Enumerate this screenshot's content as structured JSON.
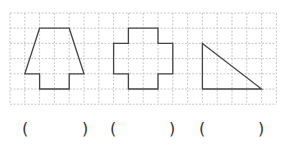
{
  "grid": {
    "origin_x": 10,
    "origin_y": 13,
    "cols": 18,
    "rows": 6,
    "cell_w": 14.8,
    "cell_h": 15.2,
    "line_color": "#c8c8c8",
    "shape_color": "#444444"
  },
  "shapes": [
    {
      "name": "trapezoid-house-shape",
      "points": [
        [
          2,
          1
        ],
        [
          4,
          1
        ],
        [
          5,
          4
        ],
        [
          4,
          4
        ],
        [
          4,
          5
        ],
        [
          2,
          5
        ],
        [
          2,
          4
        ],
        [
          1,
          4
        ]
      ]
    },
    {
      "name": "cross-shape",
      "points": [
        [
          8,
          1
        ],
        [
          10,
          1
        ],
        [
          10,
          2
        ],
        [
          11,
          2
        ],
        [
          11,
          4
        ],
        [
          10,
          4
        ],
        [
          10,
          5
        ],
        [
          8,
          5
        ],
        [
          8,
          4
        ],
        [
          7,
          4
        ],
        [
          7,
          2
        ],
        [
          8,
          2
        ]
      ]
    },
    {
      "name": "right-triangle-shape",
      "points": [
        [
          13,
          2
        ],
        [
          17,
          5
        ],
        [
          13,
          5
        ]
      ]
    }
  ],
  "answers": [
    {
      "open": "(",
      "close": ")",
      "open_x": 22,
      "close_x": 82
    },
    {
      "open": "(",
      "close": ")",
      "open_x": 110,
      "close_x": 169
    },
    {
      "open": "(",
      "close": ")",
      "open_x": 199,
      "close_x": 258
    }
  ]
}
